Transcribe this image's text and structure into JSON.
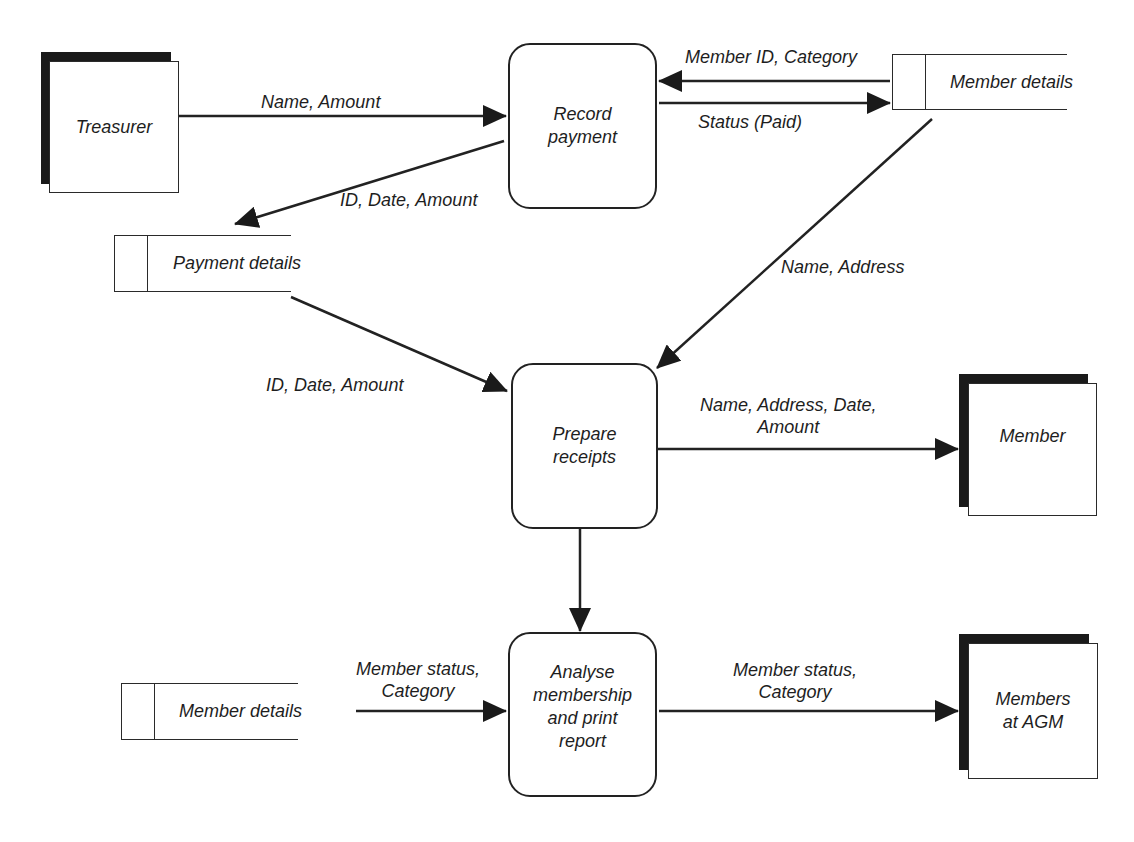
{
  "diagram": {
    "type": "data-flow-diagram",
    "external_entities": [
      {
        "id": "treasurer",
        "label": "Treasurer"
      },
      {
        "id": "member",
        "label": "Member"
      },
      {
        "id": "members_agm",
        "label": "Members at AGM"
      }
    ],
    "processes": [
      {
        "id": "record_payment",
        "label": "Record payment"
      },
      {
        "id": "prepare_receipts",
        "label": "Prepare receipts"
      },
      {
        "id": "analyse",
        "label": "Analyse membership and print report"
      }
    ],
    "data_stores": [
      {
        "id": "member_details_top",
        "label": "Member details"
      },
      {
        "id": "payment_details",
        "label": "Payment details"
      },
      {
        "id": "member_details_bottom",
        "label": "Member details"
      }
    ],
    "flows": [
      {
        "from": "treasurer",
        "to": "record_payment",
        "label": "Name, Amount"
      },
      {
        "from": "member_details_top",
        "to": "record_payment",
        "label": "Member ID, Category"
      },
      {
        "from": "record_payment",
        "to": "member_details_top",
        "label": "Status (Paid)"
      },
      {
        "from": "record_payment",
        "to": "payment_details",
        "label": "ID, Date, Amount"
      },
      {
        "from": "member_details_top",
        "to": "prepare_receipts",
        "label": "Name, Address"
      },
      {
        "from": "payment_details",
        "to": "prepare_receipts",
        "label": "ID, Date, Amount"
      },
      {
        "from": "prepare_receipts",
        "to": "member",
        "label": "Name, Address, Date, Amount"
      },
      {
        "from": "prepare_receipts",
        "to": "analyse",
        "label": ""
      },
      {
        "from": "member_details_bottom",
        "to": "analyse",
        "label": "Member status, Category"
      },
      {
        "from": "analyse",
        "to": "members_agm",
        "label": "Member status, Category"
      }
    ]
  },
  "labels": {
    "treasurer": "Treasurer",
    "member": "Member",
    "members_agm_l1": "Members",
    "members_agm_l2": "at AGM",
    "record_payment_l1": "Record",
    "record_payment_l2": "payment",
    "prepare_receipts_l1": "Prepare",
    "prepare_receipts_l2": "receipts",
    "analyse_l1": "Analyse",
    "analyse_l2": "membership",
    "analyse_l3": "and print",
    "analyse_l4": "report",
    "store_member_details_top": "Member details",
    "store_payment_details": "Payment details",
    "store_member_details_bottom": "Member details",
    "flow_name_amount": "Name, Amount",
    "flow_member_id_category": "Member ID, Category",
    "flow_status_paid": "Status (Paid)",
    "flow_id_date_amount_1": "ID, Date, Amount",
    "flow_name_address": "Name, Address",
    "flow_id_date_amount_2": "ID, Date, Amount",
    "flow_receipt_l1": "Name, Address, Date,",
    "flow_receipt_l2": "Amount",
    "flow_status_cat_in_l1": "Member status,",
    "flow_status_cat_in_l2": "Category",
    "flow_status_cat_out_l1": "Member status,",
    "flow_status_cat_out_l2": "Category"
  },
  "colors": {
    "line": "#222222",
    "shadow": "#1a1a1a",
    "background": "#ffffff"
  }
}
